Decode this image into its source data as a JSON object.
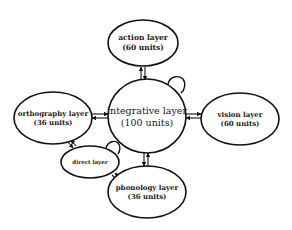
{
  "diagram": {
    "nodes": {
      "action": {
        "label": "action layer",
        "units": "(60 units)"
      },
      "integrative": {
        "label": "integrative layer",
        "units": "(100 units)"
      },
      "orthography": {
        "label": "orthography layer",
        "units": "(36 units)"
      },
      "vision": {
        "label": "vision layer",
        "units": "(60 units)"
      },
      "direct": {
        "label": "direct layer"
      },
      "phonology": {
        "label": "phonology layer",
        "units": "(36 units)"
      }
    },
    "edges": [
      {
        "from": "integrative",
        "to": "action",
        "bidirectional": true
      },
      {
        "from": "orthography",
        "to": "integrative",
        "bidirectional": true
      },
      {
        "from": "integrative",
        "to": "vision",
        "bidirectional": true
      },
      {
        "from": "integrative",
        "to": "phonology",
        "bidirectional": true
      },
      {
        "from": "orthography",
        "to": "direct",
        "bidirectional": true
      },
      {
        "from": "direct",
        "to": "phonology",
        "bidirectional": true
      }
    ],
    "self_loops": [
      "integrative",
      "direct"
    ],
    "colors": {
      "stroke": "#111111",
      "background": "#ffffff",
      "text": "#1a1a1a"
    }
  }
}
